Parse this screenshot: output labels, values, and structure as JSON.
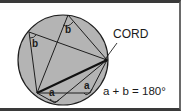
{
  "diagram": {
    "colors": {
      "circle_fill": "#b4b4b4",
      "stroke": "#1e1e1e",
      "background": "#ffffff",
      "border": "#3a3a3a"
    },
    "circle": {
      "cx": 63,
      "cy": 57,
      "r": 45
    },
    "points": {
      "b_left": [
        29,
        29
      ],
      "b_top": [
        68,
        12
      ],
      "cord_end": [
        107,
        57
      ],
      "a_left": [
        37,
        90
      ],
      "a_right": [
        90,
        90
      ],
      "bottom_left": [
        22,
        84
      ]
    },
    "angle_labels": [
      {
        "text": "b",
        "x": 66,
        "y": 29,
        "position": "top"
      },
      {
        "text": "b",
        "x": 32,
        "y": 43,
        "position": "left"
      },
      {
        "text": "a",
        "x": 50,
        "y": 94,
        "position": "bottom-left"
      },
      {
        "text": "a",
        "x": 85,
        "y": 85,
        "position": "bottom-right"
      }
    ],
    "cord_label": "CORD",
    "equation": "a + b = 180°"
  }
}
